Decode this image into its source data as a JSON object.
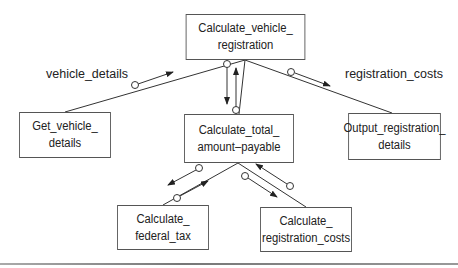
{
  "diagram": {
    "type": "structure-chart",
    "modules": {
      "top": {
        "line1": "Calculate_vehicle_",
        "line2": "registration"
      },
      "get_vehicle": {
        "line1": "Get_vehicle_",
        "line2": "details"
      },
      "calc_total": {
        "line1": "Calculate_total_",
        "line2": "amount–payable"
      },
      "output": {
        "line1": "Output_registration_",
        "line2": "details"
      },
      "federal_tax": {
        "line1": "Calculate_",
        "line2": "federal_tax"
      },
      "reg_costs": {
        "line1": "Calculate_",
        "line2": "registration_costs"
      }
    },
    "flow_labels": {
      "vehicle_details": "vehicle_details",
      "registration_costs": "registration_costs"
    },
    "colors": {
      "line": "#333333",
      "box_border": "#555555",
      "background": "#ffffff"
    }
  }
}
